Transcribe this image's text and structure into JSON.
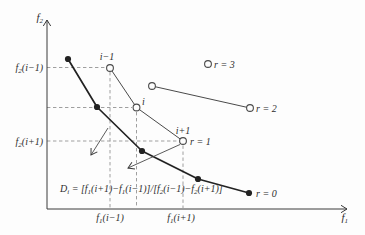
{
  "figure": {
    "background_color": "#fdfdfd",
    "ink_color": "#2e2e2e",
    "thin_line_color": "#4a4a4a",
    "dashed_line_color": "#949494"
  },
  "axis": {
    "y_label": {
      "base": "f",
      "sub": "2"
    },
    "x_label": {
      "base": "f",
      "sub": "1"
    }
  },
  "tick_labels": {
    "f2_i_minus_1": {
      "base": "f",
      "sub": "2",
      "rest": "(i−1)"
    },
    "f2_i_plus_1": {
      "base": "f",
      "sub": "2",
      "rest": "(i+1)"
    },
    "f1_i_minus_1": {
      "base": "f",
      "sub": "1",
      "rest": "(i−1)"
    },
    "f1_i_plus_1": {
      "base": "f",
      "sub": "1",
      "rest": "(i+1)"
    }
  },
  "point_labels": {
    "i_minus_1": "i−1",
    "i": "i",
    "i_plus_1": "i+1"
  },
  "rank_labels": {
    "r0": "r = 0",
    "r1": "r = 1",
    "r2": "r = 2",
    "r3": "r = 3"
  },
  "fronts": [
    {
      "rank": 0,
      "label": "r = 0",
      "marker": "filled-dot",
      "num_points": 5
    },
    {
      "rank": 1,
      "label": "r = 1",
      "marker": "open-circle",
      "num_points": 3,
      "point_names": [
        "i−1",
        "i",
        "i+1"
      ]
    },
    {
      "rank": 2,
      "label": "r = 2",
      "marker": "open-circle",
      "num_points": 2
    },
    {
      "rank": 3,
      "label": "r = 3",
      "marker": "open-circle",
      "num_points": 1
    }
  ],
  "formula": {
    "D": "D",
    "D_sub": "i",
    "eq": " = [",
    "f1a": "f",
    "f1a_sub": "1",
    "t1": "(i+1)−",
    "f1b": "f",
    "f1b_sub": "1",
    "t2": "(i−1)]/[",
    "f2a": "f",
    "f2a_sub": "2",
    "t3": "(i−1)−",
    "f2b": "f",
    "f2b_sub": "2",
    "t4": "(i+1)]"
  }
}
